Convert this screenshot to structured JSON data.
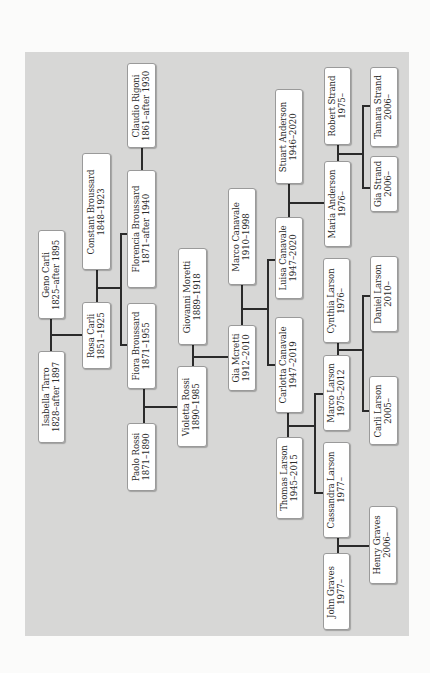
{
  "diagram": {
    "type": "family-tree",
    "orientation": "rotated-90-ccw",
    "colors": {
      "page_background": "#fbfbfa",
      "panel_background": "#d7d7d6",
      "box_fill": "#ffffff",
      "box_border": "#9a9a9a",
      "connector": "#2a2a2a",
      "text": "#2b2b2b"
    },
    "people": [
      {
        "id": "geno-carli",
        "name": "Geno Carli",
        "dates": "1825–after 1895"
      },
      {
        "id": "isabella-tarro",
        "name": "Isabella Tarro",
        "dates": "1828–after 1897"
      },
      {
        "id": "constant-broussard",
        "name": "Constant Broussard",
        "dates": "1848–1923"
      },
      {
        "id": "rosa-carli",
        "name": "Rosa Carli",
        "dates": "1851–1925"
      },
      {
        "id": "claudio-rigoni",
        "name": "Claudio Rigoni",
        "dates": "1861–after 1930"
      },
      {
        "id": "florencia-broussard",
        "name": "Florencia Broussard",
        "dates": "1871–after 1940"
      },
      {
        "id": "fiora-broussard",
        "name": "Fiora Broussard",
        "dates": "1871–1955"
      },
      {
        "id": "paolo-rossi",
        "name": "Paolo Rossi",
        "dates": "1871–1890"
      },
      {
        "id": "giovanni-moretti",
        "name": "Giovanni Moretti",
        "dates": "1889–1918"
      },
      {
        "id": "violetta-rossi",
        "name": "Violetta Rossi",
        "dates": "1890–1985"
      },
      {
        "id": "marco-canavale",
        "name": "Marco Canavale",
        "dates": "1910–1998"
      },
      {
        "id": "gia-moretti",
        "name": "Gia Mcretti",
        "dates": "1912–2010"
      },
      {
        "id": "stuart-anderson",
        "name": "Stuart Anderson",
        "dates": "1946–2020"
      },
      {
        "id": "luisa-canavale",
        "name": "Luisa Canavale",
        "dates": "1947–2020"
      },
      {
        "id": "carlotta-canavale",
        "name": "Carlotta Canavale",
        "dates": "1947–2019"
      },
      {
        "id": "thomas-larson",
        "name": "Thomas Larson",
        "dates": "1945–2015"
      },
      {
        "id": "robert-strand",
        "name": "Robert Strand",
        "dates": "1975–"
      },
      {
        "id": "maria-anderson",
        "name": "Maria Anderson",
        "dates": "1976–"
      },
      {
        "id": "cynthia-larson",
        "name": "Cynthia Larson",
        "dates": "1976–"
      },
      {
        "id": "marco-larson",
        "name": "Marco Larson",
        "dates": "1975–2012"
      },
      {
        "id": "cassandra-larson",
        "name": "Cassandra Larson",
        "dates": "1977–"
      },
      {
        "id": "john-graves",
        "name": "John Graves",
        "dates": "1977–"
      },
      {
        "id": "tamara-strand",
        "name": "Tamara Strand",
        "dates": "2006–"
      },
      {
        "id": "gia-strand",
        "name": "Gia Strand",
        "dates": "2006–"
      },
      {
        "id": "daniel-larson",
        "name": "Daniel Larson",
        "dates": "2010–"
      },
      {
        "id": "carli-larson",
        "name": "Carli Larson",
        "dates": "2005–"
      },
      {
        "id": "henry-graves",
        "name": "Henry Graves",
        "dates": "2006–"
      }
    ],
    "couples": [
      {
        "partners": [
          "Geno Carli",
          "Isabella Tarro"
        ],
        "children": [
          "Rosa Carli"
        ]
      },
      {
        "partners": [
          "Constant Broussard",
          "Rosa Carli"
        ],
        "children": [
          "Florencia Broussard",
          "Fiora Broussard"
        ]
      },
      {
        "partners": [
          "Claudio Rigoni",
          "Florencia Broussard"
        ],
        "children": []
      },
      {
        "partners": [
          "Fiora Broussard",
          "Paolo Rossi"
        ],
        "children": [
          "Violetta Rossi"
        ]
      },
      {
        "partners": [
          "Giovanni Moretti",
          "Violetta Rossi"
        ],
        "children": [
          "Gia Mcretti"
        ]
      },
      {
        "partners": [
          "Marco Canavale",
          "Gia Mcretti"
        ],
        "children": [
          "Luisa Canavale",
          "Carlotta Canavale"
        ]
      },
      {
        "partners": [
          "Stuart Anderson",
          "Luisa Canavale"
        ],
        "children": [
          "Maria Anderson"
        ]
      },
      {
        "partners": [
          "Carlotta Canavale",
          "Thomas Larson"
        ],
        "children": [
          "Marco Larson",
          "Cassandra Larson"
        ]
      },
      {
        "partners": [
          "Robert Strand",
          "Maria Anderson"
        ],
        "children": [
          "Tamara Strand",
          "Gia Strand"
        ]
      },
      {
        "partners": [
          "Cynthia Larson",
          "Marco Larson"
        ],
        "children": [
          "Daniel Larson",
          "Carli Larson"
        ]
      },
      {
        "partners": [
          "Cassandra Larson",
          "John Graves"
        ],
        "children": [
          "Henry Graves"
        ]
      }
    ]
  }
}
